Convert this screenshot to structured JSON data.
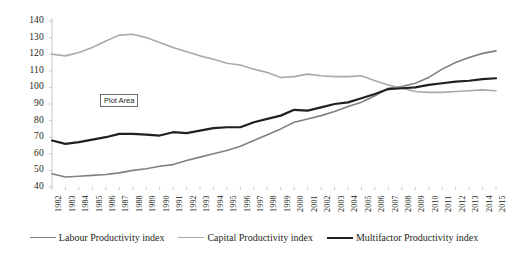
{
  "chart_data": {
    "type": "line",
    "title": "",
    "xlabel": "",
    "ylabel": "",
    "ylim": [
      40,
      140
    ],
    "ytick_step": 10,
    "grid": false,
    "legend_position": "bottom",
    "categories": [
      "1982",
      "1983",
      "1984",
      "1985",
      "1986",
      "1987",
      "1988",
      "1989",
      "1990",
      "1991",
      "1992",
      "1993",
      "1994",
      "1995",
      "1996",
      "1997",
      "1998",
      "1999",
      "2000",
      "2001",
      "2002",
      "2003",
      "2004",
      "2005",
      "2006",
      "2007",
      "2008",
      "2009",
      "2010",
      "2011",
      "2012",
      "2013",
      "2014",
      "2015"
    ],
    "yticks": [
      40,
      50,
      60,
      70,
      80,
      90,
      100,
      110,
      120,
      130,
      140
    ],
    "series": [
      {
        "name": "Labour Productivity index",
        "color": "#808080",
        "width": 1.6,
        "values": [
          48,
          46,
          46.5,
          47,
          47.5,
          48.5,
          50,
          51,
          52.5,
          53.5,
          56,
          58,
          60,
          62,
          64.5,
          68,
          71.5,
          75,
          79,
          81,
          83,
          85.5,
          88.5,
          91,
          95,
          99.5,
          100.5,
          102.5,
          106,
          111,
          115,
          118,
          120.5,
          122
        ]
      },
      {
        "name": "Capital Productivity index",
        "color": "#aaaaaa",
        "width": 1.6,
        "values": [
          120,
          119,
          121,
          124,
          128,
          131.5,
          132,
          130,
          127,
          124,
          121.5,
          119,
          117,
          114.5,
          113.5,
          111,
          109,
          106,
          106.5,
          108,
          107,
          106.5,
          106.5,
          107,
          104,
          101.5,
          99.5,
          97.5,
          97,
          97,
          97.5,
          98,
          98.5,
          98
        ]
      },
      {
        "name": "Multifactor Productivity index",
        "color": "#231f20",
        "width": 2.2,
        "values": [
          68,
          66,
          67,
          68.5,
          70,
          72,
          72,
          71.5,
          71,
          73,
          72.5,
          74,
          75.5,
          76,
          76,
          79,
          81,
          83,
          86.5,
          86,
          88,
          90,
          91,
          93.5,
          96,
          99,
          99.5,
          100,
          101.5,
          102.5,
          103.5,
          104,
          105,
          105.5
        ]
      }
    ],
    "annotation": {
      "label": "Plot Area"
    }
  },
  "legend": {
    "items": [
      {
        "label": "Labour Productivity index"
      },
      {
        "label": "Capital Productivity index"
      },
      {
        "label": "Multifactor Productivity index"
      }
    ]
  },
  "axis": {
    "left_color": "#c8c8c8",
    "tick_color": "#c8c8c8"
  }
}
